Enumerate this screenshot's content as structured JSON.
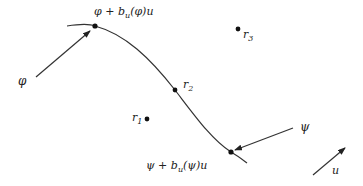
{
  "diagram": {
    "colors": {
      "line": "#333333",
      "dot": "#111111",
      "text": "#222222"
    },
    "curve": {
      "label": "trajectory curve"
    },
    "points": {
      "phi_shift": {
        "label_main": "φ + b",
        "label_sub": "u",
        "label_tail": "(φ)u"
      },
      "psi_shift": {
        "label_main": "ψ + b",
        "label_sub": "u",
        "label_tail": "(ψ)u"
      },
      "r1": {
        "label_main": "r",
        "label_sub": "1"
      },
      "r2": {
        "label_main": "r",
        "label_sub": "2"
      },
      "r3": {
        "label_main": "r",
        "label_sub": "3"
      }
    },
    "arrows": {
      "phi": {
        "label": "φ"
      },
      "psi": {
        "label": "ψ"
      },
      "u": {
        "label": "u"
      }
    }
  }
}
